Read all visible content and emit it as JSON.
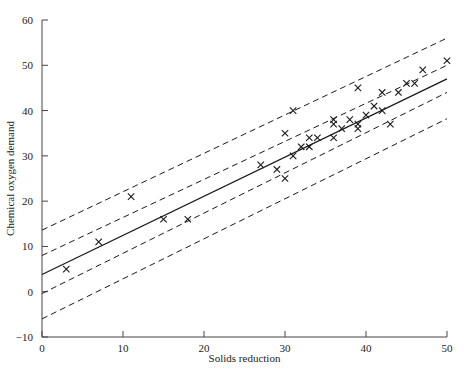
{
  "chart_data": {
    "type": "scatter",
    "title": "",
    "xlabel": "Solids reduction",
    "ylabel": "Chemical oxygen demand",
    "xlim": [
      0,
      50
    ],
    "ylim": [
      -10,
      60
    ],
    "xticks": [
      0,
      10,
      20,
      30,
      40,
      50
    ],
    "yticks": [
      -10,
      0,
      10,
      20,
      30,
      40,
      50,
      60
    ],
    "xtick_labels": [
      "0",
      "10",
      "20",
      "30",
      "40",
      "50"
    ],
    "ytick_labels": [
      "-10",
      "0",
      "10",
      "20",
      "30",
      "40",
      "50",
      "60"
    ],
    "grid": false,
    "legend": "none",
    "marker": "x",
    "points": [
      {
        "x": 3,
        "y": 5
      },
      {
        "x": 7,
        "y": 11
      },
      {
        "x": 11,
        "y": 21
      },
      {
        "x": 15,
        "y": 16
      },
      {
        "x": 18,
        "y": 16
      },
      {
        "x": 27,
        "y": 28
      },
      {
        "x": 29,
        "y": 27
      },
      {
        "x": 30,
        "y": 25
      },
      {
        "x": 30,
        "y": 35
      },
      {
        "x": 31,
        "y": 30
      },
      {
        "x": 31,
        "y": 40
      },
      {
        "x": 32,
        "y": 32
      },
      {
        "x": 33,
        "y": 34
      },
      {
        "x": 33,
        "y": 32
      },
      {
        "x": 34,
        "y": 34
      },
      {
        "x": 36,
        "y": 37
      },
      {
        "x": 36,
        "y": 38
      },
      {
        "x": 36,
        "y": 34
      },
      {
        "x": 37,
        "y": 36
      },
      {
        "x": 38,
        "y": 38
      },
      {
        "x": 39,
        "y": 37
      },
      {
        "x": 39,
        "y": 36
      },
      {
        "x": 39,
        "y": 45
      },
      {
        "x": 40,
        "y": 39
      },
      {
        "x": 41,
        "y": 41
      },
      {
        "x": 42,
        "y": 40
      },
      {
        "x": 42,
        "y": 44
      },
      {
        "x": 43,
        "y": 37
      },
      {
        "x": 44,
        "y": 44
      },
      {
        "x": 45,
        "y": 46
      },
      {
        "x": 46,
        "y": 46
      },
      {
        "x": 47,
        "y": 49
      },
      {
        "x": 50,
        "y": 51
      }
    ],
    "lines": [
      {
        "name": "regression-line",
        "style": "solid",
        "x0": 0,
        "y0": 3.8,
        "x1": 50,
        "y1": 47.0
      },
      {
        "name": "confidence-band-upper",
        "style": "dashed",
        "x0": 0,
        "y0": 8.0,
        "x1": 50,
        "y1": 50.0
      },
      {
        "name": "confidence-band-lower",
        "style": "dashed",
        "x0": 0,
        "y0": -0.4,
        "x1": 50,
        "y1": 44.0
      },
      {
        "name": "prediction-band-upper",
        "style": "dashed",
        "x0": 0,
        "y0": 13.6,
        "x1": 50,
        "y1": 56.0
      },
      {
        "name": "prediction-band-lower",
        "style": "dashed",
        "x0": 0,
        "y0": -6.0,
        "x1": 50,
        "y1": 38.2
      }
    ],
    "colors": {
      "line": "#1a1a1a",
      "marker": "#1a1a1a",
      "axis": "#444444",
      "background": "#ffffff"
    }
  }
}
